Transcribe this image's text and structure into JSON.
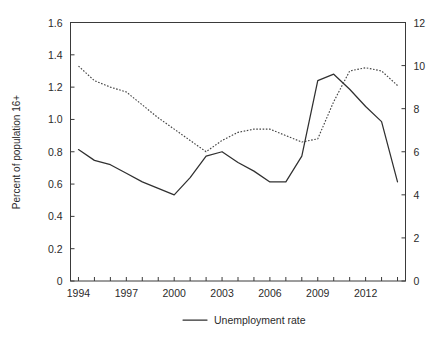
{
  "chart_data": {
    "type": "line",
    "title": "",
    "xlabel": "",
    "ylabel": "Percent of population 16+",
    "ylabel_right": "",
    "grid": false,
    "legend_position": "bottom-center",
    "x": [
      1994,
      1995,
      1996,
      1997,
      1998,
      1999,
      2000,
      2001,
      2002,
      2003,
      2004,
      2005,
      2006,
      2007,
      2008,
      2009,
      2010,
      2011,
      2012,
      2013,
      2014
    ],
    "xlim": [
      1993.5,
      2014.5
    ],
    "xticks": [
      1994,
      1995,
      1996,
      1997,
      1998,
      1999,
      2000,
      2001,
      2002,
      2003,
      2004,
      2005,
      2006,
      2007,
      2008,
      2009,
      2010,
      2011,
      2012,
      2013,
      2014
    ],
    "xticklabels": [
      "1994",
      "",
      "",
      "1997",
      "",
      "",
      "2000",
      "",
      "",
      "2003",
      "",
      "",
      "2006",
      "",
      "",
      "2009",
      "",
      "",
      "2012",
      "",
      ""
    ],
    "ylim": [
      0,
      1.6
    ],
    "yticks": [
      0,
      0.2,
      0.4,
      0.6,
      0.8,
      1.0,
      1.2,
      1.4,
      1.6
    ],
    "yticklabels": [
      "0",
      "0.2",
      "0.4",
      "0.6",
      "0.8",
      "1.0",
      "1.2",
      "1.4",
      "1.6"
    ],
    "ylim_right": [
      0,
      12
    ],
    "yticks_right": [
      0,
      2,
      4,
      6,
      8,
      10,
      12
    ],
    "yticklabels_right": [
      "0",
      "2",
      "4",
      "6",
      "8",
      "10",
      "12"
    ],
    "series": [
      {
        "name": "Unemployment rate",
        "axis": "right",
        "style": "solid",
        "color": "#303030",
        "values": [
          6.1,
          5.6,
          5.4,
          5.0,
          4.6,
          4.3,
          4.0,
          4.8,
          5.8,
          6.0,
          5.5,
          5.1,
          4.6,
          4.6,
          5.8,
          9.3,
          9.6,
          8.9,
          8.1,
          7.4,
          4.6
        ]
      },
      {
        "name": "",
        "axis": "left",
        "style": "dashed",
        "color": "#444444",
        "values": [
          1.33,
          1.24,
          1.2,
          1.17,
          1.09,
          1.01,
          0.94,
          0.87,
          0.8,
          0.87,
          0.92,
          0.94,
          0.94,
          0.9,
          0.86,
          0.88,
          1.11,
          1.3,
          1.32,
          1.3,
          1.21
        ]
      }
    ],
    "legend": [
      {
        "label": "Unemployment rate",
        "style": "solid",
        "color": "#303030"
      }
    ]
  }
}
